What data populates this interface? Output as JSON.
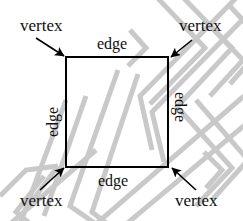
{
  "figure": {
    "colors": {
      "outline": "#000000",
      "label_text": "#101010",
      "watermark": "#c8c8c8",
      "background": "#ffffff"
    },
    "shape": {
      "name": "square",
      "x": 66,
      "y": 57,
      "width": 102,
      "height": 110,
      "stroke_width": 2
    },
    "vertex_labels": [
      {
        "id": "vertex-top-left",
        "text": "vertex",
        "x": 20,
        "y": 17
      },
      {
        "id": "vertex-top-right",
        "text": "vertex",
        "x": 179,
        "y": 17
      },
      {
        "id": "vertex-bottom-left",
        "text": "vertex",
        "x": 20,
        "y": 192
      },
      {
        "id": "vertex-bottom-right",
        "text": "vertex",
        "x": 175,
        "y": 192
      }
    ],
    "edge_labels": [
      {
        "id": "edge-top",
        "text": "edge",
        "x": 97,
        "y": 36,
        "rotation": 0
      },
      {
        "id": "edge-right",
        "text": "edge",
        "x": 188,
        "y": 92,
        "rotation": 90
      },
      {
        "id": "edge-bottom",
        "text": "edge",
        "x": 98,
        "y": 173,
        "rotation": 0
      },
      {
        "id": "edge-left",
        "text": "edge",
        "x": 45,
        "y": 137,
        "rotation": -90
      }
    ],
    "arrows": [
      {
        "id": "arrow-to-top-left-vertex",
        "from_x": 36,
        "from_y": 38,
        "to_x": 64,
        "to_y": 56
      },
      {
        "id": "arrow-to-top-right-vertex",
        "from_x": 192,
        "from_y": 40,
        "to_x": 171,
        "to_y": 57
      },
      {
        "id": "arrow-to-bottom-left-vertex",
        "from_x": 40,
        "from_y": 190,
        "to_x": 64,
        "to_y": 168
      },
      {
        "id": "arrow-to-bottom-right-vertex",
        "from_x": 196,
        "from_y": 190,
        "to_x": 172,
        "to_y": 168
      }
    ]
  }
}
